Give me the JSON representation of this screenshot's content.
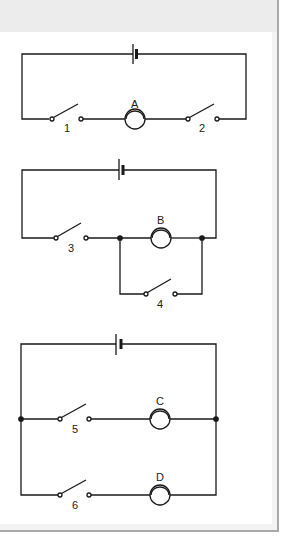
{
  "diagram": {
    "colors": {
      "wire": "#1a1a1a",
      "background": "#ffffff",
      "frame": "#a9a9a9",
      "top_band": "#ececec"
    },
    "circuits": [
      {
        "id": "circuit-1",
        "type": "series",
        "switches": [
          {
            "label": "1"
          },
          {
            "label": "2"
          }
        ],
        "bulbs": [
          {
            "label": "A"
          }
        ]
      },
      {
        "id": "circuit-2",
        "type": "series-with-shunt",
        "switches": [
          {
            "label": "3"
          },
          {
            "label": "4"
          }
        ],
        "bulbs": [
          {
            "label": "B"
          }
        ]
      },
      {
        "id": "circuit-3",
        "type": "parallel",
        "switches": [
          {
            "label": "5"
          },
          {
            "label": "6"
          }
        ],
        "bulbs": [
          {
            "label": "C"
          },
          {
            "label": "D"
          }
        ]
      }
    ]
  }
}
